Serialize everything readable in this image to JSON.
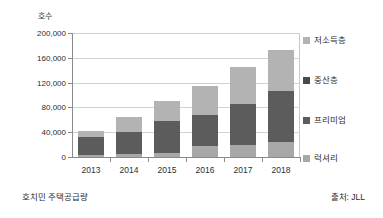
{
  "figure": {
    "y_axis_title": "호수",
    "caption_left": "호치민 주택공급량",
    "caption_right": "출처: JLL"
  },
  "colors": {
    "low_income": "#b3b3b3",
    "middle": "#4a4a4a",
    "premium": "#5c5c5c",
    "luxury": "#a8a8a8",
    "gridline": "#d2d2d2",
    "axis": "#8a8a8a",
    "text": "#2b2b2b",
    "background": "#ffffff"
  },
  "chart_data": {
    "type": "bar",
    "stacked": true,
    "title": "",
    "subtitle": "",
    "xlabel": "",
    "ylabel": "호수",
    "categories": [
      "2013",
      "2014",
      "2015",
      "2016",
      "2017",
      "2018"
    ],
    "ylim": [
      0,
      200000
    ],
    "yticks": [
      0,
      40000,
      80000,
      120000,
      160000,
      200000
    ],
    "ytick_labels": [
      "0",
      "40,000",
      "80,000",
      "120,000",
      "160,000",
      "200,000"
    ],
    "grid": true,
    "legend_position": "right",
    "series": [
      {
        "name": "럭셔리",
        "color": "#a8a8a8",
        "values": [
          3000,
          5000,
          6000,
          17000,
          20000,
          24000
        ]
      },
      {
        "name": "프리미엄",
        "color": "#5c5c5c",
        "values": [
          30000,
          36000,
          52000,
          51000,
          65000,
          83000
        ]
      },
      {
        "name": "중산층",
        "color": "#4a4a4a",
        "values": [
          0,
          0,
          0,
          0,
          0,
          0
        ]
      },
      {
        "name": "저소득층",
        "color": "#b3b3b3",
        "values": [
          9000,
          24000,
          32000,
          47000,
          60000,
          65000
        ]
      }
    ],
    "totals": [
      42000,
      65000,
      90000,
      115000,
      145000,
      172000
    ]
  },
  "legend": {
    "items": [
      {
        "label": "저소득층",
        "color": "#b3b3b3"
      },
      {
        "label": "중산층",
        "color": "#4a4a4a"
      },
      {
        "label": "프리미엄",
        "color": "#5c5c5c"
      },
      {
        "label": "럭셔리",
        "color": "#a8a8a8"
      }
    ]
  }
}
